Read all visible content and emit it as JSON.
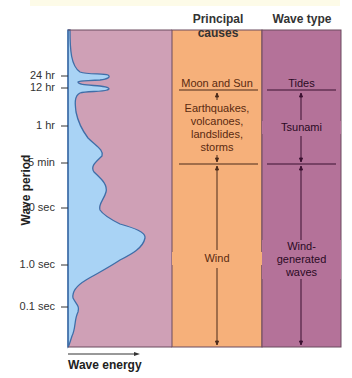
{
  "headers": {
    "causes": "Principal causes",
    "wave_type": "Wave type"
  },
  "axes": {
    "y_title": "Wave period",
    "x_title": "Wave energy",
    "ticks": [
      {
        "label": "24 hr",
        "y": 76
      },
      {
        "label": "12 hr",
        "y": 88
      },
      {
        "label": "1 hr",
        "y": 126
      },
      {
        "label": "5 min",
        "y": 163
      },
      {
        "label": "30 sec",
        "y": 208
      },
      {
        "label": "1.0 sec",
        "y": 265
      },
      {
        "label": "0.1 sec",
        "y": 307
      }
    ]
  },
  "causes": {
    "moon_sun": "Moon and Sun",
    "earthquakes": [
      "Earthquakes,",
      "volcanoes,",
      "landslides,",
      "storms"
    ],
    "wind": "Wind"
  },
  "wave_types": {
    "tides": "Tides",
    "tsunami": "Tsunami",
    "wind_generated": [
      "Wind-",
      "generated",
      "waves"
    ]
  },
  "colors": {
    "energy_panel": "#cfa0b6",
    "energy_fill": "#a9d3f5",
    "curve": "#3f6ea8",
    "causes_panel": "#f6b07a",
    "wavetype_panel": "#b47299",
    "border": "#6b4a5e"
  }
}
